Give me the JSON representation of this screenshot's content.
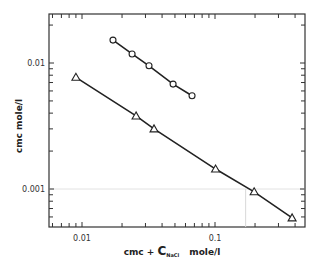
{
  "chart_data": {
    "type": "line",
    "title": "",
    "xlabel": "cmc + C_NaCl  mole/l",
    "xlabel_parts": {
      "pre": "cmc + ",
      "C": "C",
      "sub": "NaCl",
      "post": "mole/l"
    },
    "ylabel": "cmc  mole/l",
    "xscale": "log",
    "yscale": "log",
    "xlim": [
      0.0057,
      0.45
    ],
    "ylim": [
      0.00055,
      0.033
    ],
    "x_tick_labels": [
      "0.01",
      "0.1"
    ],
    "y_tick_labels": [
      "0.01",
      "0.001"
    ],
    "grid": false,
    "legend": null,
    "series": [
      {
        "name": "circles",
        "marker": "circle",
        "x": [
          0.0171,
          0.0238,
          0.0319,
          0.0484,
          0.0672
        ],
        "y": [
          0.0152,
          0.0118,
          0.0095,
          0.0068,
          0.0055
        ]
      },
      {
        "name": "triangles",
        "marker": "triangle",
        "x": [
          0.009,
          0.0255,
          0.0348,
          0.101,
          0.197,
          0.38
        ],
        "y": [
          0.0077,
          0.0038,
          0.003,
          0.00144,
          0.00095,
          0.00059
        ]
      }
    ]
  }
}
